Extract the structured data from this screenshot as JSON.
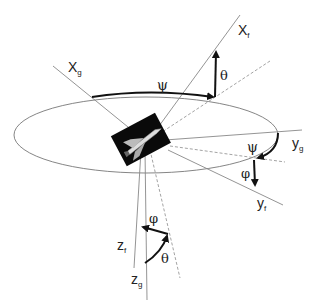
{
  "diagram": {
    "type": "coordinate-frame-rotation",
    "axes": {
      "x_ground": {
        "label": "X",
        "sub": "g"
      },
      "x_flight": {
        "label": "X",
        "sub": "f"
      },
      "y_ground": {
        "label": "y",
        "sub": "g"
      },
      "y_flight": {
        "label": "y",
        "sub": "f"
      },
      "z_ground": {
        "label": "z",
        "sub": "g"
      },
      "z_flight": {
        "label": "z",
        "sub": "f"
      }
    },
    "angles": {
      "psi_top": "ψ",
      "theta_top": "θ",
      "psi_right": "ψ",
      "phi_right": "φ",
      "phi_bottom": "φ",
      "theta_bottom": "θ"
    },
    "colors": {
      "line": "#888888",
      "arrow": "#111111",
      "ellipse": "#777777",
      "dashed": "#999999"
    }
  }
}
